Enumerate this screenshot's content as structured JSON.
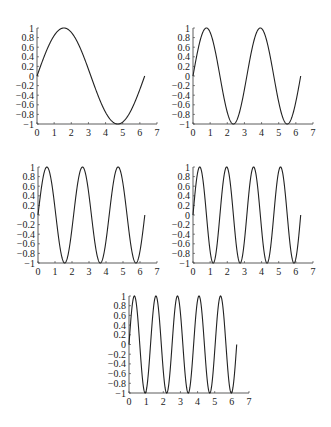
{
  "figure": {
    "width": 331,
    "height": 427,
    "line_color": "#222222",
    "axis_color": "#333333",
    "background": "#ffffff"
  },
  "chart_data": [
    {
      "type": "line",
      "title": "",
      "function": "sin(1x)",
      "frequency": 1,
      "x_range": [
        0,
        6.2832
      ],
      "xlabel": "",
      "ylabel": "",
      "xlim": [
        0,
        7
      ],
      "ylim": [
        -1,
        1
      ],
      "xticks": [
        "0",
        "1",
        "2",
        "3",
        "4",
        "5",
        "6",
        "7"
      ],
      "yticks": [
        "1",
        "0.8",
        "0.6",
        "0.4",
        "0.2",
        "0",
        "−0.2",
        "−0.4",
        "−0.6",
        "−0.8",
        "−1"
      ],
      "grid": false,
      "layout": {
        "x0": 37,
        "x7": 157,
        "ytop": 28,
        "ybot": 124
      }
    },
    {
      "type": "line",
      "title": "",
      "function": "sin(2x)",
      "frequency": 2,
      "x_range": [
        0,
        6.2832
      ],
      "xlabel": "",
      "ylabel": "",
      "xlim": [
        0,
        7
      ],
      "ylim": [
        -1,
        1
      ],
      "xticks": [
        "0",
        "1",
        "2",
        "3",
        "4",
        "5",
        "6",
        "7"
      ],
      "yticks": [
        "1",
        "0.8",
        "0.6",
        "0.4",
        "0.2",
        "0",
        "−0.2",
        "−0.4",
        "−0.6",
        "−0.8",
        "−1"
      ],
      "grid": false,
      "layout": {
        "x0": 193,
        "x7": 313,
        "ytop": 28,
        "ybot": 124
      }
    },
    {
      "type": "line",
      "title": "",
      "function": "sin(3x)",
      "frequency": 3,
      "x_range": [
        0,
        6.2832
      ],
      "xlabel": "",
      "ylabel": "",
      "xlim": [
        0,
        7
      ],
      "ylim": [
        -1,
        1
      ],
      "xticks": [
        "0",
        "1",
        "2",
        "3",
        "4",
        "5",
        "6",
        "7"
      ],
      "yticks": [
        "1",
        "0.8",
        "0.6",
        "0.4",
        "0.2",
        "0",
        "−0.2",
        "−0.4",
        "−0.6",
        "−0.8",
        "−1"
      ],
      "grid": false,
      "layout": {
        "x0": 38,
        "x7": 157,
        "ytop": 167,
        "ybot": 263
      }
    },
    {
      "type": "line",
      "title": "",
      "function": "sin(4x)",
      "frequency": 4,
      "x_range": [
        0,
        6.2832
      ],
      "xlabel": "",
      "ylabel": "",
      "xlim": [
        0,
        7
      ],
      "ylim": [
        -1,
        1
      ],
      "xticks": [
        "0",
        "1",
        "2",
        "3",
        "4",
        "5",
        "6",
        "7"
      ],
      "yticks": [
        "1",
        "0.8",
        "0.6",
        "0.4",
        "0.2",
        "0",
        "−0.2",
        "−0.4",
        "−0.6",
        "−0.8",
        "−1"
      ],
      "grid": false,
      "layout": {
        "x0": 193,
        "x7": 313,
        "ytop": 167,
        "ybot": 263
      }
    },
    {
      "type": "line",
      "title": "",
      "function": "sin(5x)",
      "frequency": 5,
      "x_range": [
        0,
        6.2832
      ],
      "xlabel": "",
      "ylabel": "",
      "xlim": [
        0,
        7
      ],
      "ylim": [
        -1,
        1
      ],
      "xticks": [
        "0",
        "1",
        "2",
        "3",
        "4",
        "5",
        "6",
        "7"
      ],
      "yticks": [
        "1",
        "0.8",
        "0.6",
        "0.4",
        "0.2",
        "0",
        "−0.2",
        "−0.4",
        "−0.6",
        "−0.8",
        "−1"
      ],
      "grid": false,
      "layout": {
        "x0": 129,
        "x7": 249,
        "ytop": 296,
        "ybot": 393
      }
    }
  ]
}
